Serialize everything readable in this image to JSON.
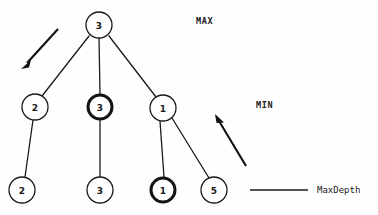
{
  "diagram": {
    "background_color": "#fefefe",
    "stroke_color": "#1a1a1a",
    "highlight_color": "#141414",
    "levels": [
      {
        "name": "MAX",
        "label": "MAX",
        "depth": 0
      },
      {
        "name": "MIN",
        "label": "MIN",
        "depth": 1
      },
      {
        "name": "MaxDepth",
        "label": "MaxDepth",
        "depth": 2
      }
    ],
    "nodes": [
      {
        "id": "root",
        "value": "3",
        "cx": 99,
        "cy": 25,
        "r": 13,
        "highlighted": false,
        "level": 0
      },
      {
        "id": "n-l",
        "value": "2",
        "cx": 35,
        "cy": 107,
        "r": 13,
        "highlighted": false,
        "level": 1
      },
      {
        "id": "n-m",
        "value": "3",
        "cx": 100,
        "cy": 107,
        "r": 12.5,
        "highlighted": true,
        "level": 1
      },
      {
        "id": "n-r",
        "value": "1",
        "cx": 163,
        "cy": 108,
        "r": 13,
        "highlighted": false,
        "level": 1
      },
      {
        "id": "l-l",
        "value": "2",
        "cx": 22,
        "cy": 190,
        "r": 13,
        "highlighted": false,
        "level": 2
      },
      {
        "id": "l-m",
        "value": "3",
        "cx": 100,
        "cy": 190,
        "r": 13,
        "highlighted": false,
        "level": 2
      },
      {
        "id": "l-r1",
        "value": "1",
        "cx": 163,
        "cy": 190,
        "r": 12.5,
        "highlighted": true,
        "level": 2
      },
      {
        "id": "l-r2",
        "value": "5",
        "cx": 214,
        "cy": 190,
        "r": 13,
        "highlighted": false,
        "level": 2
      }
    ],
    "edges": [
      {
        "from": "root",
        "to": "n-l"
      },
      {
        "from": "root",
        "to": "n-m"
      },
      {
        "from": "root",
        "to": "n-r"
      },
      {
        "from": "n-l",
        "to": "l-l"
      },
      {
        "from": "n-m",
        "to": "l-m"
      },
      {
        "from": "n-r",
        "to": "l-r1"
      },
      {
        "from": "n-r",
        "to": "l-r2"
      }
    ],
    "annotations": {
      "max_label": "MAX",
      "max_label_x": 196,
      "max_label_y": 21,
      "min_label": "MIN",
      "min_label_x": 256,
      "min_label_y": 105,
      "maxdepth_label": "MaxDepth",
      "maxdepth_label_x": 317,
      "maxdepth_label_y": 190,
      "legend_line_x1": 250,
      "legend_line_x2": 308,
      "legend_line_y": 190
    },
    "arrows": [
      {
        "id": "max-arrow",
        "direction": "down-left",
        "x1": 58,
        "y1": 29,
        "x2": 23,
        "y2": 67
      },
      {
        "id": "min-arrow",
        "direction": "up-left",
        "x1": 246,
        "y1": 166,
        "x2": 216,
        "y2": 116
      }
    ]
  }
}
